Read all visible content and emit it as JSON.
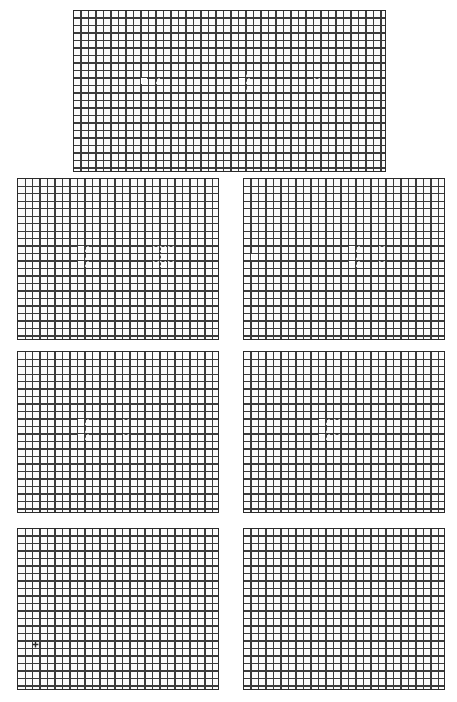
{
  "figure": {
    "type": "grid-schematic-panels",
    "background": "#ffffff",
    "grid": {
      "cell_px": 7.5,
      "line_color": "#3b3b3b",
      "fill_color": "#fbfbfb"
    },
    "palette": {
      "very_dark": "#2a2a2a",
      "dark": "#3a3a3a",
      "mid_dark": "#4f4f4f",
      "mid": "#6a6a6a",
      "light_gray": "#9a9a9a",
      "pale_gray": "#b9b9b9",
      "white": "#ffffff"
    },
    "marker_glyphs": {
      "square": "square-marker",
      "triangle": "triangle-marker",
      "cross": "x-cross-marker",
      "plus": "plus-marker"
    }
  },
  "panels": [
    {
      "id": "panel-top",
      "name": "panel-top",
      "x": 73,
      "y": 10,
      "w": 313,
      "h": 162,
      "cols": 41,
      "rows": 21,
      "blocks": [
        {
          "name": "horizontal-bar-left",
          "col": 0,
          "row": 9,
          "cw": 18,
          "ch": 2,
          "color": "#3a3a3a"
        },
        {
          "name": "vertical-stem",
          "col": 18,
          "row": 7,
          "cw": 3,
          "ch": 6,
          "color": "#6a6a6a"
        },
        {
          "name": "horizontal-bar-mid",
          "col": 21,
          "row": 9,
          "cw": 9,
          "ch": 2,
          "color": "#3a3a3a"
        },
        {
          "name": "horizontal-bar-right",
          "col": 30,
          "row": 9,
          "cw": 11,
          "ch": 2,
          "color": "#2a2a2a"
        }
      ],
      "markers": [
        {
          "name": "square-marker",
          "glyph": "square",
          "col": 9,
          "row": 9
        },
        {
          "name": "triangle-marker",
          "glyph": "triangle",
          "col": 11,
          "row": 9
        },
        {
          "name": "square-marker",
          "glyph": "square",
          "col": 22,
          "row": 8
        },
        {
          "name": "triangle-marker",
          "glyph": "triangle",
          "col": 23,
          "row": 8
        },
        {
          "name": "square-marker",
          "glyph": "square",
          "col": 22,
          "row": 9
        },
        {
          "name": "triangle-marker",
          "glyph": "triangle",
          "col": 23,
          "row": 9
        },
        {
          "name": "square-marker",
          "glyph": "square",
          "col": 22,
          "row": 10
        },
        {
          "name": "triangle-marker",
          "glyph": "triangle",
          "col": 23,
          "row": 10
        },
        {
          "name": "x-cross-marker",
          "glyph": "cross",
          "col": 32,
          "row": 8
        },
        {
          "name": "x-cross-marker",
          "glyph": "cross",
          "col": 32,
          "row": 9
        },
        {
          "name": "x-cross-marker",
          "glyph": "cross",
          "col": 32,
          "row": 10
        }
      ]
    },
    {
      "id": "panel-r2-left",
      "name": "panel-row2-left",
      "x": 17,
      "y": 178,
      "w": 202,
      "h": 162,
      "cols": 26,
      "rows": 21,
      "blocks": [
        {
          "name": "horizontal-bar-left",
          "col": 0,
          "row": 10,
          "cw": 4,
          "ch": 2,
          "color": "#3a3a3a"
        },
        {
          "name": "vertical-stem",
          "col": 4,
          "row": 7,
          "cw": 3,
          "ch": 9,
          "color": "#9a9a9a"
        },
        {
          "name": "vertical-stem-core",
          "col": 4,
          "row": 9,
          "cw": 3,
          "ch": 4,
          "color": "#6a6a6a"
        },
        {
          "name": "horizontal-bar-mid",
          "col": 7,
          "row": 9,
          "cw": 12,
          "ch": 3,
          "color": "#3a3a3a"
        },
        {
          "name": "horizontal-bar-right",
          "col": 19,
          "row": 9,
          "cw": 7,
          "ch": 3,
          "color": "#2a2a2a"
        }
      ],
      "markers": [
        {
          "name": "square-marker",
          "glyph": "square",
          "col": 8,
          "row": 9
        },
        {
          "name": "triangle-marker",
          "glyph": "triangle",
          "col": 9,
          "row": 9
        },
        {
          "name": "square-marker",
          "glyph": "square",
          "col": 8,
          "row": 10
        },
        {
          "name": "triangle-marker",
          "glyph": "triangle",
          "col": 9,
          "row": 10
        },
        {
          "name": "square-marker",
          "glyph": "square",
          "col": 8,
          "row": 11
        },
        {
          "name": "triangle-marker",
          "glyph": "triangle",
          "col": 9,
          "row": 11
        },
        {
          "name": "x-cross-marker",
          "glyph": "cross",
          "col": 18,
          "row": 9
        },
        {
          "name": "x-cross-marker",
          "glyph": "cross",
          "col": 19,
          "row": 9
        },
        {
          "name": "x-cross-marker",
          "glyph": "cross",
          "col": 20,
          "row": 9
        },
        {
          "name": "x-cross-marker",
          "glyph": "cross",
          "col": 18,
          "row": 10
        },
        {
          "name": "x-cross-marker",
          "glyph": "cross",
          "col": 19,
          "row": 10
        },
        {
          "name": "x-cross-marker",
          "glyph": "cross",
          "col": 20,
          "row": 10
        },
        {
          "name": "x-cross-marker",
          "glyph": "cross",
          "col": 18,
          "row": 11
        },
        {
          "name": "x-cross-marker",
          "glyph": "cross",
          "col": 19,
          "row": 11
        },
        {
          "name": "x-cross-marker",
          "glyph": "cross",
          "col": 20,
          "row": 11
        }
      ]
    },
    {
      "id": "panel-r2-right",
      "name": "panel-row2-right",
      "x": 243,
      "y": 178,
      "w": 202,
      "h": 162,
      "cols": 26,
      "rows": 21,
      "blocks": [
        {
          "name": "horizontal-bar-left",
          "col": 0,
          "row": 10,
          "cw": 4,
          "ch": 2,
          "color": "#3a3a3a"
        },
        {
          "name": "vertical-stem",
          "col": 4,
          "row": 7,
          "cw": 3,
          "ch": 9,
          "color": "#9a9a9a"
        },
        {
          "name": "vertical-stem-core",
          "col": 4,
          "row": 9,
          "cw": 3,
          "ch": 4,
          "color": "#6a6a6a"
        },
        {
          "name": "horizontal-bar-mid",
          "col": 7,
          "row": 9,
          "cw": 11,
          "ch": 3,
          "color": "#3a3a3a"
        },
        {
          "name": "horizontal-bar-right",
          "col": 18,
          "row": 9,
          "cw": 7,
          "ch": 3,
          "color": "#2a2a2a"
        }
      ],
      "markers": [
        {
          "name": "square-marker",
          "glyph": "square",
          "col": 1,
          "row": 10
        },
        {
          "name": "triangle-marker",
          "glyph": "triangle",
          "col": 2,
          "row": 10
        },
        {
          "name": "square-marker",
          "glyph": "square",
          "col": 14,
          "row": 9
        },
        {
          "name": "triangle-marker",
          "glyph": "triangle",
          "col": 15,
          "row": 9
        },
        {
          "name": "square-marker",
          "glyph": "square",
          "col": 14,
          "row": 10
        },
        {
          "name": "triangle-marker",
          "glyph": "triangle",
          "col": 15,
          "row": 10
        },
        {
          "name": "square-marker",
          "glyph": "square",
          "col": 14,
          "row": 11
        },
        {
          "name": "triangle-marker",
          "glyph": "triangle",
          "col": 15,
          "row": 11
        },
        {
          "name": "x-cross-marker",
          "glyph": "cross",
          "col": 18,
          "row": 9
        },
        {
          "name": "x-cross-marker",
          "glyph": "cross",
          "col": 18,
          "row": 10
        },
        {
          "name": "x-cross-marker",
          "glyph": "cross",
          "col": 18,
          "row": 11
        }
      ]
    },
    {
      "id": "panel-r3-left",
      "name": "panel-row3-left",
      "x": 17,
      "y": 351,
      "w": 202,
      "h": 162,
      "cols": 26,
      "rows": 21,
      "blocks": [
        {
          "name": "horizontal-bar-left",
          "col": 0,
          "row": 10,
          "cw": 4,
          "ch": 2,
          "color": "#3a3a3a"
        },
        {
          "name": "vertical-stem",
          "col": 4,
          "row": 7,
          "cw": 3,
          "ch": 9,
          "color": "#9a9a9a"
        },
        {
          "name": "vertical-stem-core",
          "col": 4,
          "row": 9,
          "cw": 3,
          "ch": 4,
          "color": "#6a6a6a"
        },
        {
          "name": "horizontal-bar-mid",
          "col": 7,
          "row": 9,
          "cw": 7,
          "ch": 3,
          "color": "#3a3a3a"
        },
        {
          "name": "horizontal-bar-right",
          "col": 14,
          "row": 9,
          "cw": 11,
          "ch": 3,
          "color": "#2a2a2a"
        }
      ],
      "markers": [
        {
          "name": "square-marker",
          "glyph": "square",
          "col": 8,
          "row": 9
        },
        {
          "name": "triangle-marker",
          "glyph": "triangle",
          "col": 9,
          "row": 9
        },
        {
          "name": "square-marker",
          "glyph": "square",
          "col": 8,
          "row": 10
        },
        {
          "name": "triangle-marker",
          "glyph": "triangle",
          "col": 9,
          "row": 10
        },
        {
          "name": "square-marker",
          "glyph": "square",
          "col": 8,
          "row": 11
        },
        {
          "name": "triangle-marker",
          "glyph": "triangle",
          "col": 9,
          "row": 11
        },
        {
          "name": "x-cross-marker",
          "glyph": "cross",
          "col": 14,
          "row": 9
        },
        {
          "name": "x-cross-marker",
          "glyph": "cross",
          "col": 14,
          "row": 10
        },
        {
          "name": "x-cross-marker",
          "glyph": "cross",
          "col": 14,
          "row": 11
        }
      ]
    },
    {
      "id": "panel-r3-right",
      "name": "panel-row3-right",
      "x": 243,
      "y": 351,
      "w": 202,
      "h": 162,
      "cols": 26,
      "rows": 21,
      "blocks": [
        {
          "name": "horizontal-bar-left",
          "col": 0,
          "row": 10,
          "cw": 4,
          "ch": 2,
          "color": "#3a3a3a"
        },
        {
          "name": "vertical-stem",
          "col": 4,
          "row": 7,
          "cw": 3,
          "ch": 9,
          "color": "#9a9a9a"
        },
        {
          "name": "vertical-stem-core",
          "col": 4,
          "row": 9,
          "cw": 3,
          "ch": 4,
          "color": "#6a6a6a"
        },
        {
          "name": "horizontal-bar-mid",
          "col": 7,
          "row": 9,
          "cw": 7,
          "ch": 3,
          "color": "#3a3a3a"
        },
        {
          "name": "horizontal-bar-right",
          "col": 14,
          "row": 9,
          "cw": 11,
          "ch": 3,
          "color": "#2a2a2a"
        }
      ],
      "markers": [
        {
          "name": "square-marker",
          "glyph": "square",
          "col": 10,
          "row": 9
        },
        {
          "name": "triangle-marker",
          "glyph": "triangle",
          "col": 11,
          "row": 9
        },
        {
          "name": "x-cross-marker",
          "glyph": "cross",
          "col": 12,
          "row": 9
        },
        {
          "name": "square-marker",
          "glyph": "square",
          "col": 10,
          "row": 10
        },
        {
          "name": "triangle-marker",
          "glyph": "triangle",
          "col": 11,
          "row": 10
        },
        {
          "name": "x-cross-marker",
          "glyph": "cross",
          "col": 12,
          "row": 10
        },
        {
          "name": "square-marker",
          "glyph": "square",
          "col": 10,
          "row": 11
        },
        {
          "name": "triangle-marker",
          "glyph": "triangle",
          "col": 11,
          "row": 11
        },
        {
          "name": "x-cross-marker",
          "glyph": "cross",
          "col": 12,
          "row": 11
        }
      ]
    },
    {
      "id": "panel-r4-left",
      "name": "panel-row4-left",
      "x": 17,
      "y": 528,
      "w": 202,
      "h": 162,
      "cols": 26,
      "rows": 21,
      "blocks": [
        {
          "name": "horizontal-bar-left",
          "col": 0,
          "row": 10,
          "cw": 4,
          "ch": 2,
          "color": "#3a3a3a"
        },
        {
          "name": "vertical-stem",
          "col": 4,
          "row": 7,
          "cw": 3,
          "ch": 9,
          "color": "#9a9a9a"
        },
        {
          "name": "vertical-stem-core",
          "col": 4,
          "row": 9,
          "cw": 3,
          "ch": 4,
          "color": "#6a6a6a"
        },
        {
          "name": "horizontal-bar-mid",
          "col": 7,
          "row": 9,
          "cw": 18,
          "ch": 3,
          "color": "#3a3a3a"
        }
      ],
      "markers": [
        {
          "name": "plus-marker",
          "glyph": "plus",
          "col": 2,
          "row": 15
        }
      ]
    },
    {
      "id": "panel-r4-right",
      "name": "panel-row4-right",
      "x": 243,
      "y": 528,
      "w": 202,
      "h": 162,
      "cols": 26,
      "rows": 21,
      "blocks": [
        {
          "name": "horizontal-bar-left",
          "col": 0,
          "row": 10,
          "cw": 4,
          "ch": 2,
          "color": "#3a3a3a"
        },
        {
          "name": "vertical-stem",
          "col": 4,
          "row": 7,
          "cw": 3,
          "ch": 9,
          "color": "#9a9a9a"
        },
        {
          "name": "vertical-stem-core",
          "col": 4,
          "row": 9,
          "cw": 3,
          "ch": 4,
          "color": "#6a6a6a"
        },
        {
          "name": "horizontal-bar-mid",
          "col": 7,
          "row": 9,
          "cw": 18,
          "ch": 3,
          "color": "#3a3a3a"
        }
      ],
      "markers": []
    }
  ]
}
